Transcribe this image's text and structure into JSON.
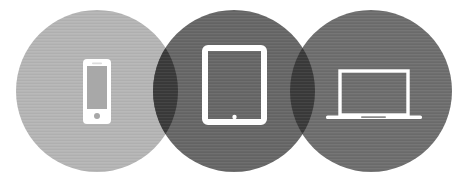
{
  "graphic": {
    "title": "Multi-device circles graphic",
    "width": 467,
    "height": 185,
    "background_color": "#ffffff",
    "overlap_color": "#3a3a3a",
    "icon_color": "#ffffff",
    "texture": "horizontal-scanlines"
  },
  "circles": [
    {
      "id": "circle-phone",
      "label": "Smartphone",
      "icon": "smartphone-icon",
      "color": "#b5b5b5",
      "cx": 97,
      "cy": 91,
      "r": 81
    },
    {
      "id": "circle-tablet",
      "label": "Tablet",
      "icon": "tablet-icon",
      "color": "#676767",
      "cx": 234,
      "cy": 91,
      "r": 81
    },
    {
      "id": "circle-laptop",
      "label": "Laptop",
      "icon": "laptop-icon",
      "color": "#6e6e6e",
      "cx": 371,
      "cy": 91,
      "r": 81
    }
  ],
  "icons": {
    "smartphone": {
      "name": "smartphone-icon",
      "body_x": 83,
      "body_y": 59,
      "body_w": 28,
      "body_h": 65,
      "body_radius": 4,
      "screen_x": 87,
      "screen_y": 66,
      "screen_w": 20,
      "screen_h": 43,
      "home_cx": 97,
      "home_cy": 116,
      "home_r": 3,
      "speaker_x": 92,
      "speaker_y": 62.6,
      "speaker_w": 10,
      "speaker_h": 1.6,
      "fill": "#ffffff",
      "screen_fill": "#a8a8a8"
    },
    "tablet": {
      "name": "tablet-icon",
      "body_x": 205,
      "body_y": 48,
      "body_w": 59,
      "body_h": 74,
      "body_radius": 3,
      "stroke_width": 6,
      "home_cx": 234.5,
      "home_cy": 117,
      "home_r": 2.2,
      "stroke": "#ffffff"
    },
    "laptop": {
      "name": "laptop-icon",
      "screen_x": 340,
      "screen_y": 71,
      "screen_w": 68,
      "screen_h": 44,
      "screen_stroke_width": 3.4,
      "base_x": 326,
      "base_y": 115.5,
      "base_w": 96,
      "base_h": 3.6,
      "notch_x": 361,
      "notch_y": 116.2,
      "notch_w": 25,
      "notch_h": 1.8,
      "stroke": "#ffffff",
      "notch_fill": "#8d8d8d"
    }
  }
}
